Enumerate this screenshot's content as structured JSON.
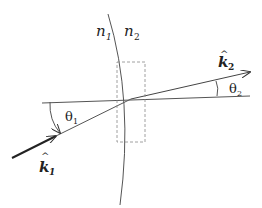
{
  "diagram": {
    "type": "refraction",
    "labels": {
      "n1": {
        "base": "n",
        "sub": "1"
      },
      "n2": {
        "base": "n",
        "sub": "2"
      },
      "k1": {
        "base": "k",
        "sub": "1",
        "hat": "^"
      },
      "k2": {
        "base": "k",
        "sub": "2",
        "hat": "^"
      },
      "theta1": {
        "base": "θ",
        "sub": "1"
      },
      "theta2": {
        "base": "θ",
        "sub": "2"
      }
    },
    "colors": {
      "line": "#444444",
      "dashed": "#888888",
      "background": "#ffffff"
    }
  }
}
